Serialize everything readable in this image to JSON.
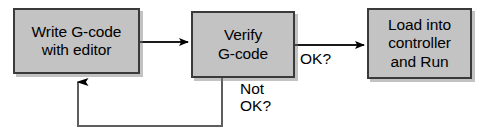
{
  "diagram": {
    "background_color": "#ffffff",
    "node_fill_color": "#c3c3c3",
    "node_border_color": "#3a3a3a",
    "text_color": "#000000",
    "nodes": [
      {
        "id": "write",
        "lines": [
          "Write G-code",
          "with editor"
        ],
        "line1": "Write G-code",
        "line2": "with editor"
      },
      {
        "id": "verify",
        "lines": [
          "Verify",
          "G-code"
        ],
        "line1": "Verify",
        "line2": "G-code"
      },
      {
        "id": "load",
        "lines": [
          "Load into",
          "controller",
          "and Run"
        ],
        "line1": "Load into",
        "line2": "controller",
        "line3": "and Run"
      }
    ],
    "edge_labels": [
      {
        "id": "ok",
        "line1": "OK?"
      },
      {
        "id": "not_ok",
        "line1": "Not",
        "line2": "OK?"
      }
    ],
    "connectors": [
      {
        "id": "write-to-verify",
        "from": "write",
        "to": "verify",
        "arrow": "right"
      },
      {
        "id": "verify-to-load",
        "from": "verify",
        "to": "load",
        "arrow": "right",
        "label": "OK?"
      },
      {
        "id": "verify-back-to-write",
        "from": "verify",
        "to": "write",
        "arrow": "up",
        "label": "Not OK?"
      }
    ]
  }
}
